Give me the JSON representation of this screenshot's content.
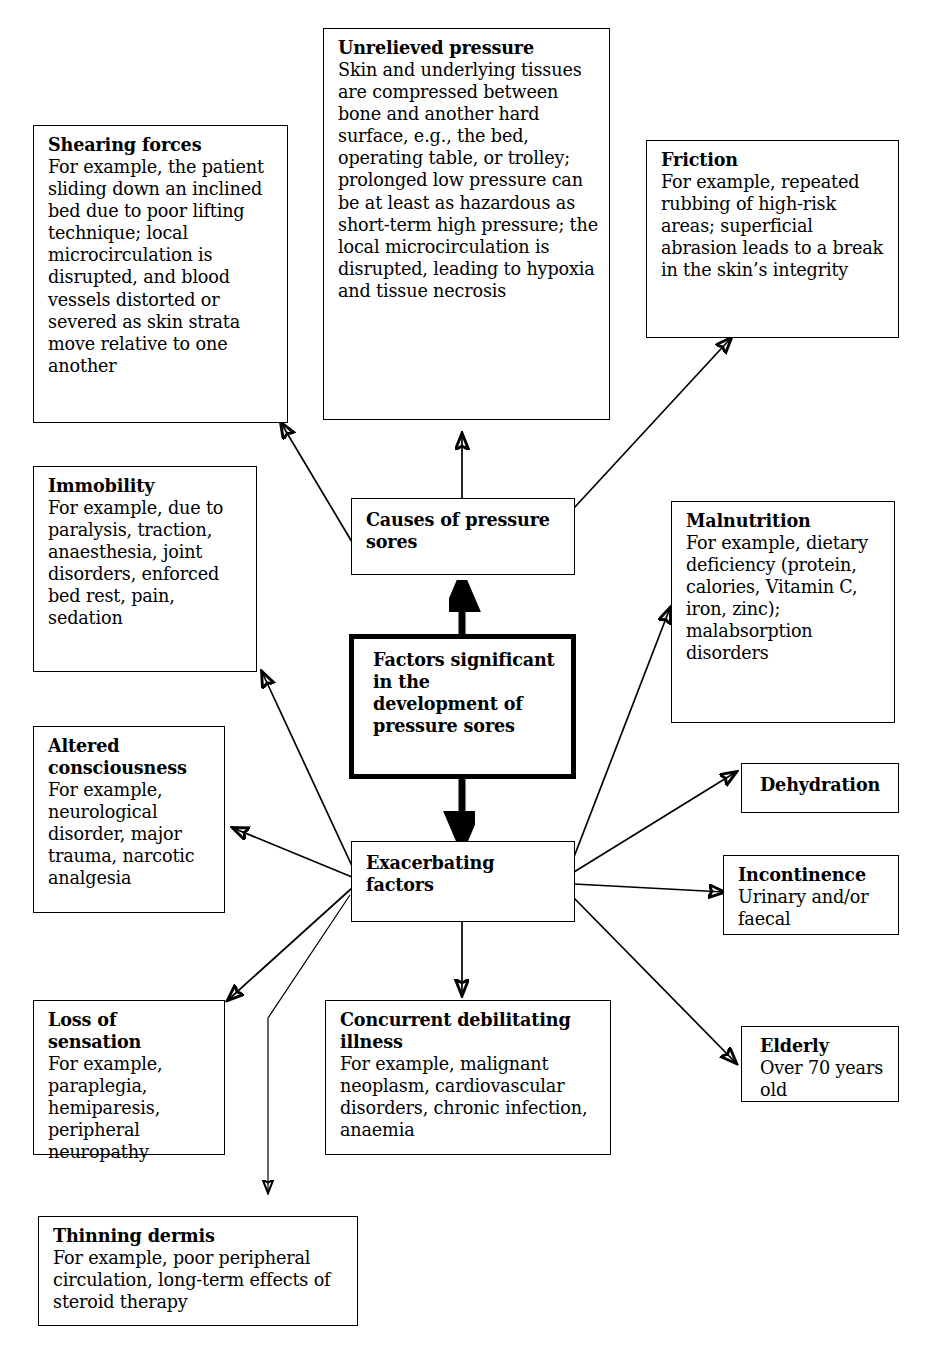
{
  "diagram": {
    "title_node": {
      "title": "Factors significant",
      "lines": [
        "in the",
        "development of",
        "pressure sores"
      ]
    },
    "nodes": {
      "shearing_forces": {
        "title": "Shearing forces",
        "body": "For example, the patient sliding down an inclined bed due to poor lifting technique; local microcirculation is disrupted, and blood vessels distorted or severed as skin strata move relative to one another"
      },
      "unrelieved_pressure": {
        "title": "Unrelieved pressure",
        "body": "Skin and underlying tissues are compressed between bone and another hard surface, e.g., the bed, operating table, or trolley; prolonged low pressure can be at least as hazardous as short-term high pressure; the local microcirculation is disrupted, leading to hypoxia and tissue necrosis"
      },
      "friction": {
        "title": "Friction",
        "body": "For example, repeated rubbing of high-risk areas; superficial abrasion leads to a break in the skin’s integrity"
      },
      "immobility": {
        "title": "Immobility",
        "body": "For example, due to paralysis, traction, anaesthesia, joint disorders, enforced bed rest, pain, sedation"
      },
      "causes_of_pressure_sores": {
        "title": "Causes of pressure sores",
        "body": ""
      },
      "malnutrition": {
        "title": "Malnutrition",
        "body": "For example, dietary deficiency (protein, calories, Vitamin C, iron, zinc); malabsorption disorders"
      },
      "altered_consciousness": {
        "title": "Altered consciousness",
        "body": "For example, neurological disorder, major trauma, narcotic analgesia"
      },
      "exacerbating_factors": {
        "title": "Exacerbating factors",
        "body": ""
      },
      "dehydration": {
        "title": "Dehydration",
        "body": ""
      },
      "incontinence": {
        "title": "Incontinence",
        "body": "Urinary and/or faecal"
      },
      "loss_of_sensation": {
        "title": "Loss of sensation",
        "body": "For example, paraplegia, hemiparesis, peripheral neuropathy"
      },
      "concurrent_debilitating_illness": {
        "title": "Concurrent debilitating illness",
        "body": "For example, malignant neoplasm, cardiovascular disorders, chronic infection, anaemia"
      },
      "elderly": {
        "title": "Elderly",
        "body": "Over 70 years old"
      },
      "thinning_dermis": {
        "title": "Thinning dermis",
        "body": "For example, poor peripheral circulation, long-term effects of steroid therapy"
      }
    },
    "colors": {
      "stroke": "#000000",
      "background": "#ffffff"
    }
  }
}
